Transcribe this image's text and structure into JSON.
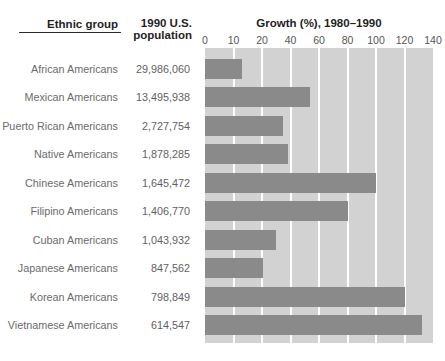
{
  "headers": {
    "ethnic_group": "Ethnic group",
    "population_line1": "1990 U.S.",
    "population_line2": "population",
    "growth": "Growth (%), 1980–1990"
  },
  "colors": {
    "bar": "#8a8a8a",
    "plot_background": "#d2d2d2",
    "gridline": "#ffffff",
    "header_text": "#1f1f1f",
    "label_text": "#6b6b6b"
  },
  "chart_data": {
    "type": "bar",
    "orientation": "horizontal",
    "title": "Growth (%), 1980–1990",
    "xlabel": "Growth (%), 1980–1990",
    "ylabel": "Ethnic group",
    "categories": [
      "African Americans",
      "Mexican Americans",
      "Puerto Rican Americans",
      "Native Americans",
      "Chinese Americans",
      "Filipino Americans",
      "Cuban Americans",
      "Japanese Americans",
      "Korean Americans",
      "Vietnamese Americans"
    ],
    "populations": [
      "29,986,060",
      "13,495,938",
      "2,727,754",
      "1,878,285",
      "1,645,472",
      "1,406,770",
      "1,043,932",
      "847,562",
      "798,849",
      "614,547"
    ],
    "values": [
      13,
      54,
      35,
      38,
      100,
      80,
      30,
      21,
      120,
      132
    ],
    "x_tick_labels": [
      "0",
      "10",
      "20",
      "40",
      "60",
      "80",
      "100",
      "120",
      "140"
    ],
    "x_tick_values": [
      0,
      10,
      20,
      40,
      60,
      80,
      100,
      120,
      140
    ],
    "x_scale_note": "ticks equally spaced although increments are 10 then 20 units",
    "grid": "vertical white gridlines on gray band",
    "legend": "none"
  }
}
